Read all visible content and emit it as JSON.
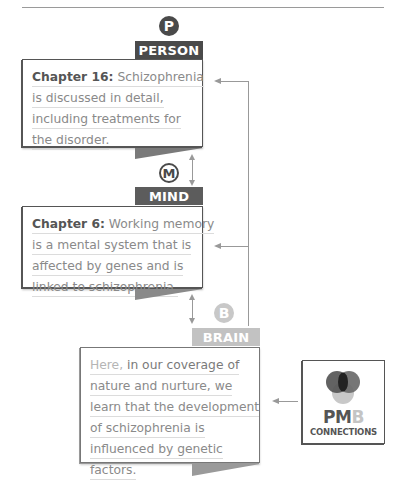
{
  "colors": {
    "person": "#4a4a4a",
    "mind": "#5c5c5c",
    "brain": "#c2c2c2",
    "rule": "#9a9a9a",
    "connector": "#999999"
  },
  "levels": [
    {
      "key": "person",
      "badge": "P",
      "tab": "PERSON",
      "lines": [
        {
          "lead": "Chapter 16:",
          "text": " Schizophrenia"
        },
        {
          "text": "is discussed in detail,"
        },
        {
          "text": "including treatments for"
        },
        {
          "text": "the disorder."
        }
      ]
    },
    {
      "key": "mind",
      "badge": "M",
      "tab": "MIND",
      "lines": [
        {
          "lead": "Chapter 6:",
          "text": " Working memory"
        },
        {
          "text": "is a mental system that is"
        },
        {
          "text": "affected by genes and is"
        },
        {
          "text": "linked to schizophrenia."
        }
      ]
    },
    {
      "key": "brain",
      "badge": "B",
      "tab": "BRAIN",
      "lines": [
        {
          "lead": "Here,",
          "text": " in our coverage of"
        },
        {
          "text": "nature and nurture, we"
        },
        {
          "text": "learn that the development"
        },
        {
          "text": "of schizophrenia is"
        },
        {
          "text": "influenced by genetic"
        },
        {
          "text": "factors."
        }
      ]
    }
  ],
  "pmb_logo": {
    "word_pm": "PM",
    "word_b": "B",
    "subtitle": "CONNECTIONS",
    "icon": "venn-three-circles-icon"
  }
}
